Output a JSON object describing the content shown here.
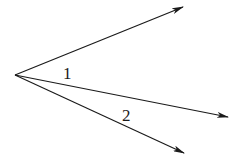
{
  "diagram": {
    "type": "angles-from-common-vertex",
    "vertex": {
      "x": 15,
      "y": 75
    },
    "rays": [
      {
        "name": "ray-top",
        "tip": {
          "x": 183,
          "y": 7
        }
      },
      {
        "name": "ray-middle",
        "tip": {
          "x": 228,
          "y": 117
        }
      },
      {
        "name": "ray-bottom",
        "tip": {
          "x": 184,
          "y": 153
        }
      }
    ],
    "labels": [
      {
        "text": "1",
        "x": 63,
        "y": 79
      },
      {
        "text": "2",
        "x": 122,
        "y": 121
      }
    ],
    "colors": {
      "stroke": "#1a1a1a",
      "background": "#ffffff"
    }
  }
}
